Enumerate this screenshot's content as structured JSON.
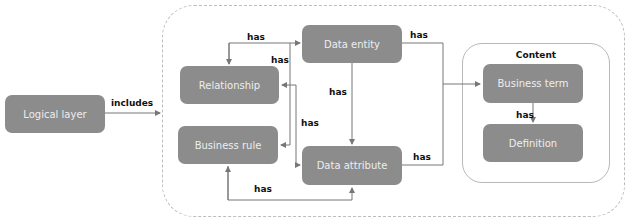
{
  "diagram": {
    "nodes": {
      "logical_layer": "Logical layer",
      "relationship": "Relationship",
      "business_rule": "Business rule",
      "data_entity": "Data entity",
      "data_attribute": "Data attribute",
      "business_term": "Business term",
      "definition": "Definition"
    },
    "groups": {
      "content": "Content"
    },
    "edge_labels": {
      "logical_includes": "includes",
      "entity_to_relationship_top": "has",
      "entity_to_relationship_side": "has",
      "entity_to_attribute": "has",
      "attribute_to_relationship": "has",
      "attribute_to_business_rule": "has",
      "entity_to_content": "has",
      "attribute_to_content": "has",
      "term_to_definition": "has"
    },
    "colors": {
      "node_fill": "#8c8c8c",
      "node_text": "#eeeeee",
      "line": "#777777",
      "outer_border": "#bdbdbd"
    }
  }
}
